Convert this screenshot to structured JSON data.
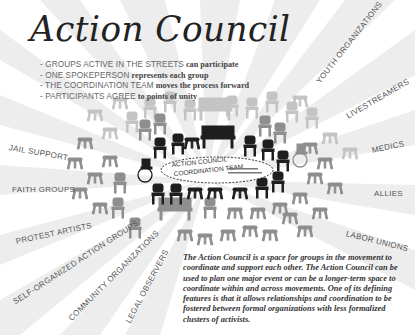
{
  "title": "Action Council",
  "bullets": [
    {
      "caps": "- GROUPS ACTIVE IN THE STREETS",
      "rest": "can participate"
    },
    {
      "caps": "- ONE SPOKEPERSON",
      "rest": "represents each group"
    },
    {
      "caps": "- THE COORDINATION TEAM",
      "rest": "moves the process forward"
    },
    {
      "caps": "- PARTICIPANTS AGREE",
      "rest": "to points of unity"
    }
  ],
  "center": {
    "line1": "ACTION COUNCIL",
    "line2": "COORDINATION TEAM"
  },
  "groups": [
    "YOUTH ORGANIZATIONS",
    "LIVESTREAMERS",
    "MEDICS",
    "ALLIES",
    "LABOR UNIONS",
    "JAIL SUPPORT",
    "FAITH GROUPS",
    "PROTEST ARTISTS",
    "SELF-ORGANIZED ACTION GROUPS",
    "COMMUNITY ORGANIZATIONS",
    "LEGAL OBSERVERS"
  ],
  "description": "The Action Council is a space for groups in the movement to coordinate and support each other. The Action Council can be used to plan one major event or can be a longer-term space to coordinate within and across movements. One of its defining features is that it allows relationships and coordination to be fostered between formal organizations with less formalized clusters of activists.",
  "colors": {
    "ray": "#ececec",
    "chair_dark": "#1e1e1e",
    "chair_mid": "#8c8c8c",
    "chair_light": "#b4b4b4",
    "text": "#555555"
  }
}
